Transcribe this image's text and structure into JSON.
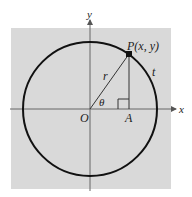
{
  "diagram": {
    "type": "unit-circle-trig",
    "colors": {
      "background": "#ffffff",
      "panel": "#d9d9d9",
      "circle": "#111111",
      "axis": "#555555",
      "lines": "#333333"
    },
    "labels": {
      "y_axis": "y",
      "x_axis": "x",
      "point": "P(x, y)",
      "radius": "r",
      "angle": "θ",
      "origin": "O",
      "foot": "A",
      "arc": "t"
    }
  }
}
